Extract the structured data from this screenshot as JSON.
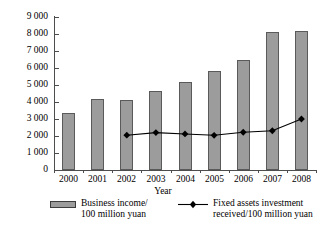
{
  "chart_data": {
    "type": "bar",
    "title": "",
    "subtitle": "",
    "xlabel": "Year",
    "ylabel": "",
    "categories": [
      "2000",
      "2001",
      "2002",
      "2003",
      "2004",
      "2005",
      "2006",
      "2007",
      "2008"
    ],
    "ylim": [
      0,
      9000
    ],
    "ytick_step": 1000,
    "yticks": [
      "9 000",
      "8 000",
      "7 000",
      "6 000",
      "5 000",
      "4 000",
      "3 000",
      "2 000",
      "1 000",
      "0"
    ],
    "ytick_values": [
      9000,
      8000,
      7000,
      6000,
      5000,
      4000,
      3000,
      2000,
      1000,
      0
    ],
    "grid": false,
    "legend_position": "bottom",
    "series": [
      {
        "name": "Business income/100 million yuan",
        "type": "bar",
        "color": "#9c9c9c",
        "values": [
          3380,
          4150,
          4120,
          4620,
          5200,
          5850,
          6500,
          8100,
          8200
        ]
      },
      {
        "name": "Fixed assets investment received/100 million yuan",
        "type": "line",
        "color": "#000000",
        "x": [
          "2002",
          "2003",
          "2004",
          "2005",
          "2006",
          "2007",
          "2008"
        ],
        "values": [
          2050,
          2200,
          2120,
          2040,
          2220,
          2310,
          3000
        ]
      }
    ]
  },
  "axes": {
    "x_title": "Year"
  },
  "legend": {
    "entries": [
      {
        "marker": "bar-swatch",
        "line1": "Business income/",
        "line2": "100 million yuan"
      },
      {
        "marker": "line-diamond",
        "line1": "Fixed assets investment",
        "line2": "received/100 million yuan"
      }
    ]
  }
}
